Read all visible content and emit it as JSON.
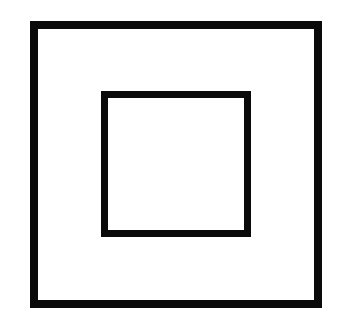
{
  "figure": {
    "symbol_name": "class-ii-double-insulation",
    "background_color": "#ffffff",
    "stroke_color": "#0a0a0a",
    "shapes": [
      {
        "name": "outer-square",
        "kind": "square-outline"
      },
      {
        "name": "inner-square",
        "kind": "square-outline"
      }
    ]
  }
}
